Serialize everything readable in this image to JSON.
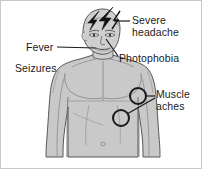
{
  "figure": {
    "background_color": "#ffffff",
    "border_color": "#c8c8c8",
    "body_fill": "#c9c9c9",
    "body_fill_light": "#d6d6d6",
    "outline_color": "#4a4a4a",
    "text_color": "#1a1a1a",
    "leader_color": "#1a1a1a"
  },
  "labels": {
    "severe_headache": {
      "line1": "Severe",
      "line2": "headache"
    },
    "fever": {
      "line1": "Fever"
    },
    "seizures": {
      "line1": "Seizures"
    },
    "photophobia": {
      "line1": "Photophobia"
    },
    "muscle_aches": {
      "line1": "Muscle",
      "line2": "aches"
    }
  },
  "markers": {
    "lightning_bolt": "lightning-bolt-icon",
    "muscle_circle_upper": {
      "cx": 137,
      "cy": 95,
      "r": 8
    },
    "muscle_circle_lower": {
      "cx": 120,
      "cy": 117,
      "r": 8
    }
  }
}
